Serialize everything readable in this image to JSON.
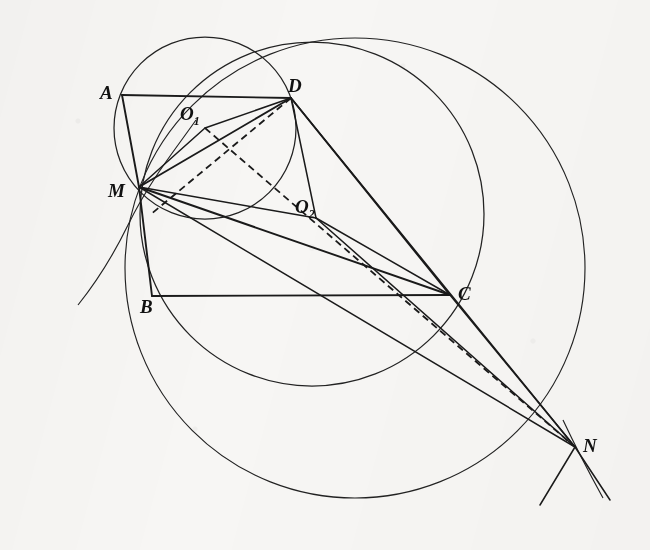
{
  "figure": {
    "caption": "",
    "background_color": "#f7f6f4",
    "ink_color": "#1a1a1a",
    "width": 650,
    "height": 550,
    "points": [
      {
        "id": "A",
        "label": "A",
        "x": 122,
        "y": 95,
        "label_x": 100,
        "label_y": 99
      },
      {
        "id": "B",
        "label": "B",
        "x": 152,
        "y": 296,
        "label_x": 140,
        "label_y": 313
      },
      {
        "id": "C",
        "label": "C",
        "x": 450,
        "y": 295,
        "label_x": 458,
        "label_y": 300
      },
      {
        "id": "D",
        "label": "D",
        "x": 291,
        "y": 98,
        "label_x": 288,
        "label_y": 92
      },
      {
        "id": "M",
        "label": "M",
        "x": 139,
        "y": 187,
        "label_x": 108,
        "label_y": 197
      },
      {
        "id": "N",
        "label": "N",
        "x": 575,
        "y": 447,
        "label_x": 583,
        "label_y": 452
      },
      {
        "id": "O1",
        "label": "O",
        "sub": "1",
        "x": 205,
        "y": 128,
        "label_x": 180,
        "label_y": 120
      },
      {
        "id": "O2",
        "label": "O",
        "sub": "2",
        "x": 316,
        "y": 218,
        "label_x": 295,
        "label_y": 213
      }
    ],
    "segments": [
      {
        "name": "segment-A-D",
        "from": "A",
        "to": "D",
        "style": "solid"
      },
      {
        "name": "segment-A-M",
        "from": "A",
        "to": "M",
        "style": "solid"
      },
      {
        "name": "segment-M-B",
        "from": "M",
        "to": "B",
        "style": "solid"
      },
      {
        "name": "segment-B-C",
        "from": "B",
        "to": "C",
        "style": "solid"
      },
      {
        "name": "segment-M-D",
        "from": "M",
        "to": "D",
        "style": "solid"
      },
      {
        "name": "segment-M-C",
        "from": "M",
        "to": "C",
        "style": "solid"
      },
      {
        "name": "segment-D-C",
        "from": "D",
        "to": "C",
        "style": "solid"
      },
      {
        "name": "segment-M-O1",
        "from": "M",
        "to": "O1",
        "style": "solid"
      },
      {
        "name": "segment-O1-D",
        "from": "O1",
        "to": "D",
        "style": "solid"
      },
      {
        "name": "segment-M-O2",
        "from": "M",
        "to": "O2",
        "style": "solid"
      },
      {
        "name": "segment-O2-C",
        "from": "O2",
        "to": "C",
        "style": "solid"
      },
      {
        "name": "segment-O2-D",
        "from": "O2",
        "to": "D",
        "style": "solid"
      },
      {
        "name": "segment-M-N",
        "from": "M",
        "to": "N",
        "style": "solid"
      },
      {
        "name": "segment-D-N",
        "from": "D",
        "to": "N",
        "style": "solid"
      },
      {
        "name": "segment-C-N",
        "from": "C",
        "to": "N",
        "style": "solid"
      },
      {
        "name": "segment-O2-N",
        "from": "O2",
        "to": "N",
        "style": "solid"
      },
      {
        "name": "segment-O1-N-dashed",
        "from": "O1",
        "to": "N",
        "style": "dashed"
      },
      {
        "name": "segment-D-M-dashed",
        "from": "D",
        "to": "M",
        "style": "dashed"
      }
    ],
    "circles": [
      {
        "name": "circle-O1",
        "center": "O1",
        "cx": 205,
        "cy": 128,
        "r": 91,
        "through": [
          "M",
          "A",
          "D"
        ]
      },
      {
        "name": "circle-O2",
        "center": "O2",
        "cx": 312,
        "cy": 214,
        "r": 172,
        "through": [
          "M",
          "D",
          "C"
        ]
      },
      {
        "name": "circle-big",
        "center": "",
        "cx": 355,
        "cy": 268,
        "r": 230,
        "through": [
          "M",
          "D",
          "C",
          "N"
        ]
      }
    ]
  }
}
